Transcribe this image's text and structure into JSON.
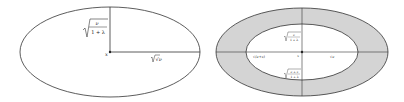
{
  "left_panel": {
    "center_label": "x",
    "vertical_label": "√(ν/(1+λ))",
    "vertical_num": "ν",
    "vertical_den": "1 + λ",
    "horizontal_label": "√ν",
    "colors": {
      "stroke": "#333333",
      "fill": "#ffffff"
    }
  },
  "right_panel": {
    "center_label": "x",
    "top_label_num": "ν",
    "top_label_den": "1 + λ",
    "bottom_label_num": "ν + ε",
    "bottom_label_den": "1 + λ",
    "left_label": "√(ν+ε)",
    "right_label": "√ν",
    "colors": {
      "ring_fill": "#d4d4d4",
      "inner_fill": "#ffffff",
      "stroke": "#333333"
    }
  }
}
